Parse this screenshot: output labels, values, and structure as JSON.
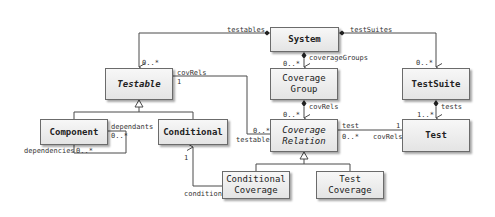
{
  "diagram": {
    "type": "uml-class-diagram",
    "classes": [
      {
        "id": "system",
        "name": "System",
        "abstract": false
      },
      {
        "id": "testable",
        "name": "Testable",
        "abstract": true
      },
      {
        "id": "coverage_group",
        "name_lines": [
          "Coverage",
          "Group"
        ],
        "abstract": false
      },
      {
        "id": "test_suite",
        "name": "TestSuite",
        "abstract": false
      },
      {
        "id": "component",
        "name": "Component",
        "abstract": false
      },
      {
        "id": "conditional",
        "name": "Conditional",
        "abstract": false
      },
      {
        "id": "coverage_relation",
        "name_lines": [
          "Coverage",
          "Relation"
        ],
        "abstract": true
      },
      {
        "id": "test",
        "name": "Test",
        "abstract": false
      },
      {
        "id": "conditional_coverage",
        "name_lines": [
          "Conditional",
          "Coverage"
        ],
        "abstract": false
      },
      {
        "id": "test_coverage",
        "name_lines": [
          "Test",
          "Coverage"
        ],
        "abstract": false
      }
    ],
    "labels": {
      "testables": "testables",
      "testables_mult": "0..*",
      "testSuites": "testSuites",
      "testSuites_mult": "0..*",
      "coverageGroups": "coverageGroups",
      "coverageGroups_mult": "0..*",
      "group_covRels": "covRels",
      "group_covRels_mult": "0..*",
      "tests": "tests",
      "tests_mult": "1..*",
      "testable_covRels": "covRels",
      "testable_covRels_mult": "1",
      "testable_end": "testable",
      "testable_end_mult": "0..*",
      "dependants": "dependants",
      "dependants_mult": "0..*",
      "dependencies": "dependencies",
      "dependencies_mult": "0..*",
      "condition": "condition",
      "condition_mult": "1",
      "test_end": "test",
      "test_end_mult": "0..*",
      "test_covRels": "covRels",
      "test_covRels_mult": "1"
    },
    "relations": [
      {
        "from": "System",
        "to": "Testable",
        "kind": "composition",
        "role": "testables",
        "multiplicity": "0..*"
      },
      {
        "from": "System",
        "to": "TestSuite",
        "kind": "composition",
        "role": "testSuites",
        "multiplicity": "0..*"
      },
      {
        "from": "System",
        "to": "Coverage Group",
        "kind": "composition",
        "role": "coverageGroups",
        "multiplicity": "0..*"
      },
      {
        "from": "Coverage Group",
        "to": "Coverage Relation",
        "kind": "composition",
        "role": "covRels",
        "multiplicity": "0..*"
      },
      {
        "from": "TestSuite",
        "to": "Test",
        "kind": "composition",
        "role": "tests",
        "multiplicity": "1..*"
      },
      {
        "from": "Testable",
        "to": "Coverage Relation",
        "kind": "association",
        "roles": [
          "covRels 1",
          "testable 0..*"
        ]
      },
      {
        "from": "Coverage Relation",
        "to": "Test",
        "kind": "association",
        "roles": [
          "test 0..*",
          "covRels 1"
        ]
      },
      {
        "from": "Component",
        "to": "Component",
        "kind": "association",
        "roles": [
          "dependants 0..*",
          "dependencies 0..*"
        ]
      },
      {
        "from": "Conditional Coverage",
        "to": "Conditional",
        "kind": "association",
        "role": "condition",
        "multiplicity": "1"
      },
      {
        "from": "Component",
        "to": "Testable",
        "kind": "generalization"
      },
      {
        "from": "Conditional",
        "to": "Testable",
        "kind": "generalization"
      },
      {
        "from": "Conditional Coverage",
        "to": "Coverage Relation",
        "kind": "generalization"
      },
      {
        "from": "Test Coverage",
        "to": "Coverage Relation",
        "kind": "generalization"
      }
    ],
    "colors": {
      "line": "#4a4a4a",
      "box_border": "#6b6b6b",
      "box_fill_top": "#f7f7f7",
      "box_fill_bottom": "#e4e4e4",
      "text": "#222222"
    }
  }
}
